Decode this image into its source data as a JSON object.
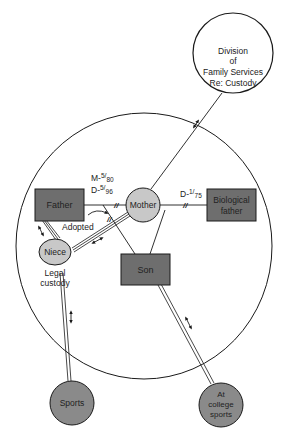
{
  "diagram": {
    "type": "ecomap",
    "colors": {
      "outline": "#1a1a1a",
      "box_fill": "#6e6e6e",
      "light_circle_fill": "#c8c8c8",
      "dark_circle_fill": "#8a8a8a",
      "background": "#ffffff"
    },
    "nodes": {
      "division": {
        "line1": "Division",
        "line2": "of",
        "line3": "Family Services",
        "line4": "Re: Custody"
      },
      "father": {
        "label": "Father"
      },
      "mother": {
        "label": "Mother"
      },
      "biological_father": {
        "line1": "Biological",
        "line2": "father"
      },
      "niece": {
        "label": "Niece"
      },
      "son": {
        "label": "Son"
      },
      "sports": {
        "label": "Sports"
      },
      "college_sports": {
        "line1": "At",
        "line2": "college",
        "line3": "sports"
      }
    },
    "annotations": {
      "marriage_date_prefix": "M-",
      "marriage_date_sup": "5",
      "marriage_date_sub": "80",
      "divorce_date_prefix": "D-",
      "divorce_date_sup": "5",
      "divorce_date_sub": "96",
      "bio_divorce_prefix": "D-",
      "bio_divorce_sup": "1",
      "bio_divorce_sub": "75",
      "adopted": "Adopted",
      "legal_line1": "Legal",
      "legal_line2": "custody"
    }
  }
}
